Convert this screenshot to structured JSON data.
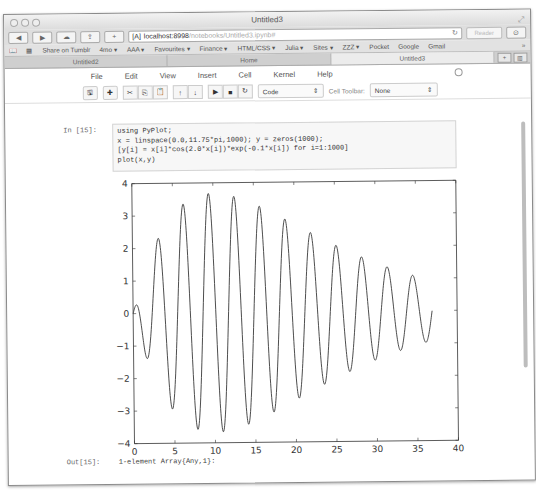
{
  "window": {
    "title": "Untitled3"
  },
  "browser": {
    "url_host": "localhost:8998",
    "url_path": "/notebooks/Untitled3.ipynb#",
    "reader_label": "Reader",
    "bookmarks": [
      "Share on Tumblr",
      "4mo ▾",
      "AAA ▾",
      "Favourites ▾",
      "Finance ▾",
      "HTML/CSS ▾",
      "Julia ▾",
      "Sites ▾",
      "ZZZ ▾",
      "Pocket",
      "Google",
      "Gmail"
    ],
    "overflow": "»",
    "tabs": [
      {
        "label": "Untitled2",
        "active": false
      },
      {
        "label": "Home",
        "active": false
      },
      {
        "label": "Untitled3",
        "active": true
      }
    ],
    "new_tab": "+",
    "tab_overview": "▥"
  },
  "notebook": {
    "menu": [
      "File",
      "Edit",
      "View",
      "Insert",
      "Cell",
      "Kernel",
      "Help"
    ],
    "toolbar": {
      "buttons": [
        {
          "icon": "save-icon",
          "glyph": "🖫"
        },
        {
          "icon": "add-cell-icon",
          "glyph": "✚"
        },
        {
          "icon": "cut-icon",
          "glyph": "✂"
        },
        {
          "icon": "copy-icon",
          "glyph": "⎘"
        },
        {
          "icon": "paste-icon",
          "glyph": "📋"
        },
        {
          "icon": "move-up-icon",
          "glyph": "↑"
        },
        {
          "icon": "move-down-icon",
          "glyph": "↓"
        },
        {
          "icon": "run-icon",
          "glyph": "▶"
        },
        {
          "icon": "stop-icon",
          "glyph": "■"
        },
        {
          "icon": "restart-icon",
          "glyph": "↻"
        }
      ],
      "cell_type": "Code",
      "cell_toolbar_label": "Cell Toolbar:",
      "cell_toolbar_value": "None"
    },
    "cell": {
      "in_prompt": "In [15]:",
      "code": "using PyPlot;\nx = linspace(0.0,11.75*pi,1000); y = zeros(1000);\n[y[i] = x[i]*cos(2.0*x[i])*exp(-0.1*x[i]) for i=1:1000]\nplot(x,y)",
      "out_prompt": "Out[15]:",
      "output": "1-element Array{Any,1}:"
    }
  },
  "chart_data": {
    "type": "line",
    "title": "",
    "xlabel": "",
    "ylabel": "",
    "xlim": [
      0,
      40
    ],
    "ylim": [
      -4,
      4
    ],
    "xticks": [
      0,
      5,
      10,
      15,
      20,
      25,
      30,
      35,
      40
    ],
    "yticks": [
      -4,
      -3,
      -2,
      -1,
      0,
      1,
      2,
      3,
      4
    ],
    "grid": false,
    "legend": null,
    "series": [
      {
        "name": "y",
        "formula": "x*cos(2x)*exp(-0.1x)",
        "x_range": [
          0.0,
          36.91
        ],
        "samples": 1000,
        "color": "#3a3a3a",
        "extrema": [
          {
            "x": 0.4,
            "y": 0.28
          },
          {
            "x": 1.6,
            "y": -1.39
          },
          {
            "x": 3.15,
            "y": 2.29
          },
          {
            "x": 4.72,
            "y": -2.95
          },
          {
            "x": 6.29,
            "y": 3.36
          },
          {
            "x": 7.86,
            "y": -3.6
          },
          {
            "x": 9.43,
            "y": 3.67
          },
          {
            "x": 11.0,
            "y": -3.67
          },
          {
            "x": 12.57,
            "y": 3.57
          },
          {
            "x": 14.14,
            "y": -3.43
          },
          {
            "x": 15.71,
            "y": 3.27
          },
          {
            "x": 17.28,
            "y": -3.07
          },
          {
            "x": 18.85,
            "y": 2.86
          },
          {
            "x": 20.42,
            "y": -2.66
          },
          {
            "x": 21.99,
            "y": 2.45
          },
          {
            "x": 23.56,
            "y": -2.23
          },
          {
            "x": 25.13,
            "y": 2.04
          },
          {
            "x": 26.7,
            "y": -1.84
          },
          {
            "x": 28.27,
            "y": 1.67
          },
          {
            "x": 29.85,
            "y": -1.5
          },
          {
            "x": 31.42,
            "y": 1.36
          },
          {
            "x": 32.99,
            "y": -1.21
          },
          {
            "x": 34.56,
            "y": 1.1
          },
          {
            "x": 36.13,
            "y": -0.97
          },
          {
            "x": 36.91,
            "y": -0.1
          }
        ]
      }
    ]
  }
}
